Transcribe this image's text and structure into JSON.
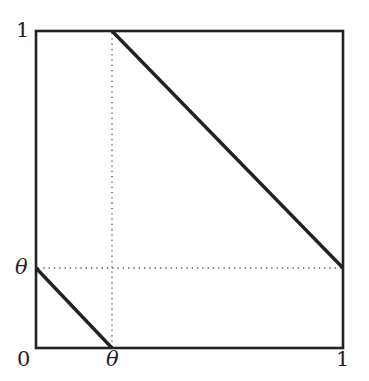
{
  "diagram": {
    "type": "unit-square-with-lines",
    "frame": {
      "x0": 36,
      "y0": 31,
      "x1": 343,
      "y1": 348
    },
    "theta_fraction": 0.25,
    "colors": {
      "line": "#222222",
      "dotted": "#555555",
      "background": "#ffffff"
    },
    "labels": {
      "y_top": "1",
      "y_theta": "θ",
      "origin": "0",
      "x_theta": "θ",
      "x_right": "1"
    },
    "segments": [
      {
        "name": "upper-diagonal",
        "from": [
          0.25,
          1
        ],
        "to": [
          1,
          0.25
        ]
      },
      {
        "name": "lower-diagonal",
        "from": [
          0,
          0.25
        ],
        "to": [
          0.25,
          0
        ]
      }
    ],
    "guides": [
      {
        "name": "vertical-theta-guide",
        "from": [
          0.25,
          0
        ],
        "to": [
          0.25,
          1
        ]
      },
      {
        "name": "horizontal-theta-guide",
        "from": [
          0,
          0.25
        ],
        "to": [
          1,
          0.25
        ]
      }
    ]
  }
}
